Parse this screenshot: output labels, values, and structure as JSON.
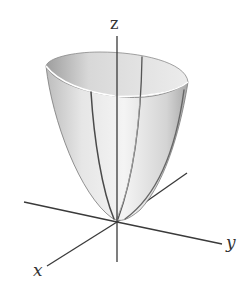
{
  "figure": {
    "surface_color": "#e8e8e8",
    "axis_color": "#3a3a3a",
    "axes": {
      "x_label": "x",
      "y_label": "y",
      "z_label": "z"
    }
  }
}
